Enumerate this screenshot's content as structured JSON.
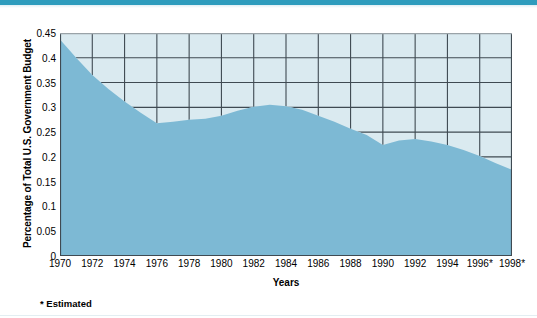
{
  "decor": {
    "top_bar_color": "#2e9cbd"
  },
  "chart_data": {
    "type": "area",
    "title": "",
    "xlabel": "Years",
    "ylabel": "Percentage of Total U.S. Government Budget",
    "ylim": [
      0,
      0.45
    ],
    "xlim": [
      1970,
      1998
    ],
    "grid": true,
    "legend": null,
    "series_color": "#7db9d4",
    "plot_background": "#daeaf0",
    "grid_color": "#3f4a52",
    "axis_color": "#3f4a52",
    "x_tick_labels": [
      "1970",
      "1972",
      "1974",
      "1976",
      "1978",
      "1980",
      "1982",
      "1984",
      "1986",
      "1988",
      "1990",
      "1992",
      "1994",
      "1996*",
      "1998*"
    ],
    "x_tick_values": [
      1970,
      1972,
      1974,
      1976,
      1978,
      1980,
      1982,
      1984,
      1986,
      1988,
      1990,
      1992,
      1994,
      1996,
      1998
    ],
    "y_tick_labels": [
      "0",
      "0.05",
      "0.1",
      "0.15",
      "0.2",
      "0.25",
      "0.3",
      "0.35",
      "0.4",
      "0.45"
    ],
    "y_tick_values": [
      0,
      0.05,
      0.1,
      0.15,
      0.2,
      0.25,
      0.3,
      0.35,
      0.4,
      0.45
    ],
    "x": [
      1970,
      1971,
      1972,
      1973,
      1974,
      1975,
      1976,
      1977,
      1978,
      1979,
      1980,
      1981,
      1982,
      1983,
      1984,
      1985,
      1986,
      1987,
      1988,
      1989,
      1990,
      1991,
      1992,
      1993,
      1994,
      1995,
      1996,
      1997,
      1998
    ],
    "values": [
      0.437,
      0.4,
      0.365,
      0.337,
      0.312,
      0.289,
      0.268,
      0.271,
      0.275,
      0.277,
      0.283,
      0.293,
      0.301,
      0.305,
      0.302,
      0.295,
      0.283,
      0.271,
      0.257,
      0.244,
      0.224,
      0.233,
      0.236,
      0.231,
      0.224,
      0.214,
      0.202,
      0.187,
      0.174
    ],
    "annotations": [
      {
        "text": "* Estimated"
      }
    ]
  },
  "footnote": {
    "text": "* Estimated"
  }
}
